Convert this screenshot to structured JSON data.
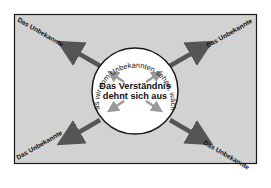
{
  "diagram": {
    "background_color": "#d2d2d2",
    "border_color": "#1a1a1a",
    "circle_fill": "#ffffff",
    "outer_arrow_color": "#555555",
    "inner_arrow_color": "#999999",
    "corner_labels": {
      "top_left": "Das Unbekannte",
      "top_right": "Das Unbekannte",
      "bottom_left": "Das Unbekannte",
      "bottom_right": "Das Unbekannte"
    },
    "circle": {
      "arc_text": "Was wir vom Unbekannten sehen, wächst",
      "center_title_line1": "Das Verständnis",
      "center_title_line2": "dehnt sich aus"
    }
  }
}
